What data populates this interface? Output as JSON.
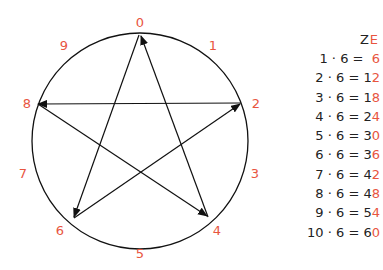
{
  "diagram": {
    "type": "multiplication-circle",
    "multiplier": 6,
    "digit_labels": [
      "0",
      "1",
      "2",
      "3",
      "4",
      "5",
      "6",
      "7",
      "8",
      "9"
    ],
    "highlight_color": "#e8553f",
    "line_color": "#111111",
    "path_order": [
      "0",
      "6",
      "2",
      "8",
      "4",
      "0"
    ]
  },
  "table": {
    "header_tens": "Z",
    "header_ones": "E",
    "rows": [
      {
        "expr": "1 · 6 = ",
        "tens": " ",
        "ones": "6"
      },
      {
        "expr": "2 · 6 = ",
        "tens": "1",
        "ones": "2"
      },
      {
        "expr": "3 · 6 = ",
        "tens": "1",
        "ones": "8"
      },
      {
        "expr": "4 · 6 = ",
        "tens": "2",
        "ones": "4"
      },
      {
        "expr": "5 · 6 = ",
        "tens": "3",
        "ones": "0"
      },
      {
        "expr": "6 · 6 = ",
        "tens": "3",
        "ones": "6"
      },
      {
        "expr": "7 · 6 = ",
        "tens": "4",
        "ones": "2"
      },
      {
        "expr": "8 · 6 = ",
        "tens": "4",
        "ones": "8"
      },
      {
        "expr": "9 · 6 = ",
        "tens": "5",
        "ones": "4"
      },
      {
        "expr": "10 · 6 = ",
        "tens": "6",
        "ones": "0"
      }
    ]
  }
}
